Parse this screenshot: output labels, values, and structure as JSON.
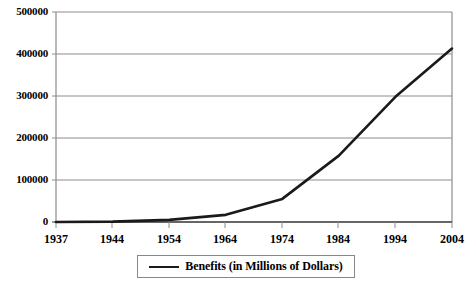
{
  "chart_data": {
    "type": "line",
    "title": "",
    "xlabel": "",
    "ylabel": "",
    "grid": "horizontal",
    "legend_position": "bottom",
    "xlim": [
      1937,
      2004
    ],
    "ylim": [
      0,
      500000
    ],
    "x_ticks": [
      "1937",
      "1944",
      "1954",
      "1964",
      "1974",
      "1984",
      "1994",
      "2004"
    ],
    "y_ticks": [
      "0",
      "100000",
      "200000",
      "300000",
      "400000",
      "500000"
    ],
    "series": [
      {
        "name": "Benefits (in Millions of Dollars)",
        "color": "#1a1a1a",
        "x": [
          1937,
          1944,
          1954,
          1964,
          1974,
          1984,
          1994,
          2004
        ],
        "values": [
          1,
          1000,
          5000,
          17000,
          55000,
          158000,
          298000,
          413000
        ]
      }
    ]
  },
  "axes": {
    "y_tick_labels": [
      "500000",
      "400000",
      "300000",
      "200000",
      "100000",
      "0"
    ],
    "x_tick_labels": [
      "1937",
      "1944",
      "1954",
      "1964",
      "1974",
      "1984",
      "1994",
      "2004"
    ]
  },
  "legend": {
    "entries": [
      {
        "label": "Benefits (in Millions of Dollars)",
        "color": "#1a1a1a"
      }
    ]
  },
  "colors": {
    "line": "#1a1a1a",
    "grid": "#8c8c8c",
    "axis": "#8c8c8c",
    "background": "#ffffff",
    "text": "#000000"
  }
}
